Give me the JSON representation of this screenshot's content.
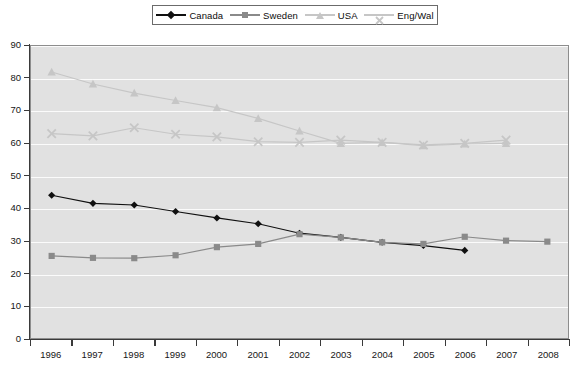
{
  "chart_data": {
    "type": "line",
    "title": "",
    "subtitle": "",
    "xlabel": "",
    "ylabel": "",
    "categories": [
      "1996",
      "1997",
      "1998",
      "1999",
      "2000",
      "2001",
      "2002",
      "2003",
      "2004",
      "2005",
      "2006",
      "2007",
      "2008"
    ],
    "ylim": [
      0,
      90
    ],
    "yticks": [
      0,
      10,
      20,
      30,
      40,
      50,
      60,
      70,
      80,
      90
    ],
    "grid": true,
    "legend_position": "top-center",
    "series": [
      {
        "name": "Canada",
        "color": "#101010",
        "marker": "diamond",
        "x": [
          "1996",
          "1997",
          "1998",
          "1999",
          "2000",
          "2001",
          "2002",
          "2003",
          "2004",
          "2005",
          "2006"
        ],
        "values": [
          44.0,
          41.5,
          41.0,
          39.0,
          37.0,
          35.2,
          32.3,
          31.0,
          29.5,
          28.5,
          27.0
        ]
      },
      {
        "name": "Sweden",
        "color": "#8a8a8a",
        "marker": "square",
        "x": [
          "1996",
          "1997",
          "1998",
          "1999",
          "2000",
          "2001",
          "2002",
          "2003",
          "2004",
          "2005",
          "2006",
          "2007",
          "2008"
        ],
        "values": [
          25.3,
          24.7,
          24.6,
          25.5,
          28.0,
          29.0,
          32.0,
          31.0,
          29.5,
          29.0,
          31.2,
          30.0,
          29.7
        ]
      },
      {
        "name": "USA",
        "color": "#c6c6c6",
        "marker": "triangle",
        "x": [
          "1996",
          "1997",
          "1998",
          "1999",
          "2000",
          "2001",
          "2002",
          "2003",
          "2004",
          "2005",
          "2006",
          "2007"
        ],
        "values": [
          82.0,
          78.3,
          75.5,
          73.2,
          71.0,
          67.7,
          63.8,
          60.0,
          60.3,
          59.3,
          59.8,
          60.0
        ]
      },
      {
        "name": "Eng/Wal",
        "color": "#c6c6c6",
        "marker": "cross",
        "x": [
          "1996",
          "1997",
          "1998",
          "1999",
          "2000",
          "2001",
          "2002",
          "2003",
          "2004",
          "2005",
          "2006",
          "2007"
        ],
        "values": [
          63.0,
          62.3,
          64.8,
          62.8,
          62.0,
          60.5,
          60.3,
          61.0,
          60.3,
          59.5,
          60.0,
          61.0
        ]
      }
    ]
  },
  "legend": {
    "items": [
      {
        "label": "Canada",
        "icon": "diamond-marker-icon"
      },
      {
        "label": "Sweden",
        "icon": "square-marker-icon"
      },
      {
        "label": "USA",
        "icon": "triangle-marker-icon"
      },
      {
        "label": "Eng/Wal",
        "icon": "cross-marker-icon"
      }
    ]
  },
  "axes": {
    "y_tick_labels": [
      "90",
      "80",
      "70",
      "60",
      "50",
      "40",
      "30",
      "20",
      "10",
      "0"
    ],
    "x_tick_labels": [
      "1996",
      "1997",
      "1998",
      "1999",
      "2000",
      "2001",
      "2002",
      "2003",
      "2004",
      "2005",
      "2006",
      "2007",
      "2008"
    ]
  }
}
